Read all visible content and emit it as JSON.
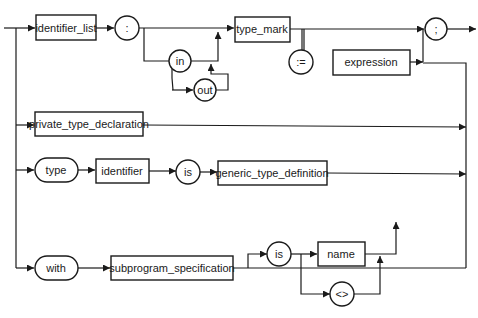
{
  "diagram": {
    "type": "syntax-diagram",
    "colors": {
      "stroke": "#1a1a1a",
      "background": "#ffffff"
    },
    "branches": [
      {
        "id": "parameter-declaration",
        "nodes": [
          {
            "kind": "nonterminal",
            "label": "identifier_list"
          },
          {
            "kind": "terminal",
            "label": ":"
          },
          {
            "kind": "terminal",
            "label": "in"
          },
          {
            "kind": "terminal",
            "label": "out"
          },
          {
            "kind": "nonterminal",
            "label": "type_mark"
          },
          {
            "kind": "terminal",
            "label": ":="
          },
          {
            "kind": "nonterminal",
            "label": "expression"
          },
          {
            "kind": "terminal",
            "label": ";"
          }
        ]
      },
      {
        "id": "private-type",
        "nodes": [
          {
            "kind": "nonterminal",
            "label": "private_type_declaration"
          }
        ]
      },
      {
        "id": "generic-type",
        "nodes": [
          {
            "kind": "terminal",
            "label": "type"
          },
          {
            "kind": "nonterminal",
            "label": "identifier"
          },
          {
            "kind": "terminal",
            "label": "is"
          },
          {
            "kind": "nonterminal",
            "label": "generic_type_definition"
          }
        ]
      },
      {
        "id": "generic-subprogram",
        "nodes": [
          {
            "kind": "terminal",
            "label": "with"
          },
          {
            "kind": "nonterminal",
            "label": "subprogram_specification"
          },
          {
            "kind": "terminal",
            "label": "is"
          },
          {
            "kind": "nonterminal",
            "label": "name"
          },
          {
            "kind": "terminal",
            "label": "<>"
          }
        ]
      }
    ]
  }
}
